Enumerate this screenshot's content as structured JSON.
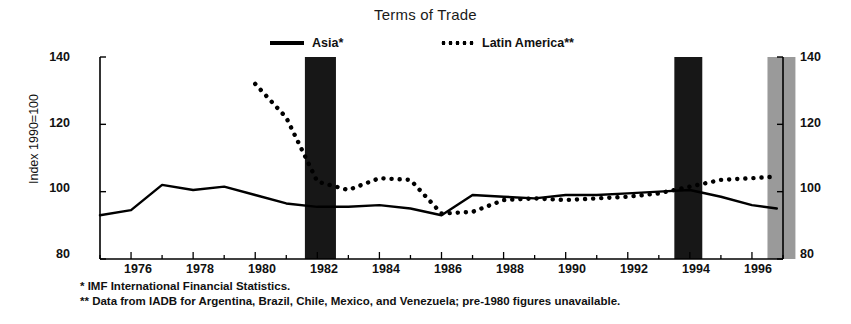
{
  "chart_data": {
    "type": "line",
    "title": "Terms of Trade",
    "xlabel": "",
    "ylabel": "Index 1990=100",
    "ylim": [
      80,
      140
    ],
    "xlim": [
      1975,
      1997
    ],
    "yticks": [
      80,
      100,
      120,
      140
    ],
    "xticks": [
      1976,
      1978,
      1980,
      1982,
      1984,
      1986,
      1988,
      1990,
      1992,
      1994,
      1996
    ],
    "grid": false,
    "legend_position": "top-center",
    "series": [
      {
        "name": "Asia*",
        "style": "solid",
        "color": "#000000",
        "x": [
          1975,
          1976,
          1977,
          1978,
          1979,
          1980,
          1981,
          1982,
          1983,
          1984,
          1985,
          1986,
          1987,
          1988,
          1989,
          1990,
          1991,
          1992,
          1993,
          1994,
          1995,
          1996,
          1996.8
        ],
        "values": [
          93.0,
          94.5,
          102.0,
          100.5,
          101.5,
          99.0,
          96.5,
          95.5,
          95.5,
          96.0,
          95.0,
          93.0,
          99.0,
          98.5,
          98.0,
          99.0,
          99.0,
          99.5,
          100.0,
          100.5,
          98.5,
          96.0,
          95.0
        ]
      },
      {
        "name": "Latin America**",
        "style": "dotted",
        "color": "#000000",
        "x": [
          1980,
          1981,
          1982,
          1983,
          1984,
          1985,
          1986,
          1987,
          1988,
          1989,
          1990,
          1991,
          1992,
          1993,
          1994,
          1995,
          1996,
          1996.8
        ],
        "values": [
          132.0,
          122.0,
          103.0,
          100.5,
          104.0,
          103.5,
          93.5,
          94.0,
          97.5,
          98.0,
          97.5,
          98.0,
          98.5,
          99.5,
          101.5,
          103.5,
          104.0,
          104.5
        ]
      }
    ],
    "shaded_bands": [
      {
        "name": "recession-band-1982",
        "start": 1981.6,
        "end": 1982.6,
        "fill": "#171717"
      },
      {
        "name": "recession-band-1994",
        "start": 1993.5,
        "end": 1994.4,
        "fill": "#171717"
      },
      {
        "name": "recession-band-1997",
        "start": 1996.5,
        "end": 1997.4,
        "fill": "#9a9a9a"
      }
    ]
  },
  "legend": {
    "asia": "Asia*",
    "latin_america": "Latin America**"
  },
  "axes": {
    "y_title": "Index 1990=100",
    "y_ticks": [
      "140",
      "120",
      "100",
      "80"
    ],
    "x_ticks": [
      "1976",
      "1978",
      "1980",
      "1982",
      "1984",
      "1986",
      "1988",
      "1990",
      "1992",
      "1994",
      "1996"
    ]
  },
  "footnotes": {
    "first": "* IMF International Financial Statistics.",
    "second": "** Data from IADB for Argentina, Brazil, Chile, Mexico, and Venezuela; pre-1980 figures unavailable."
  }
}
